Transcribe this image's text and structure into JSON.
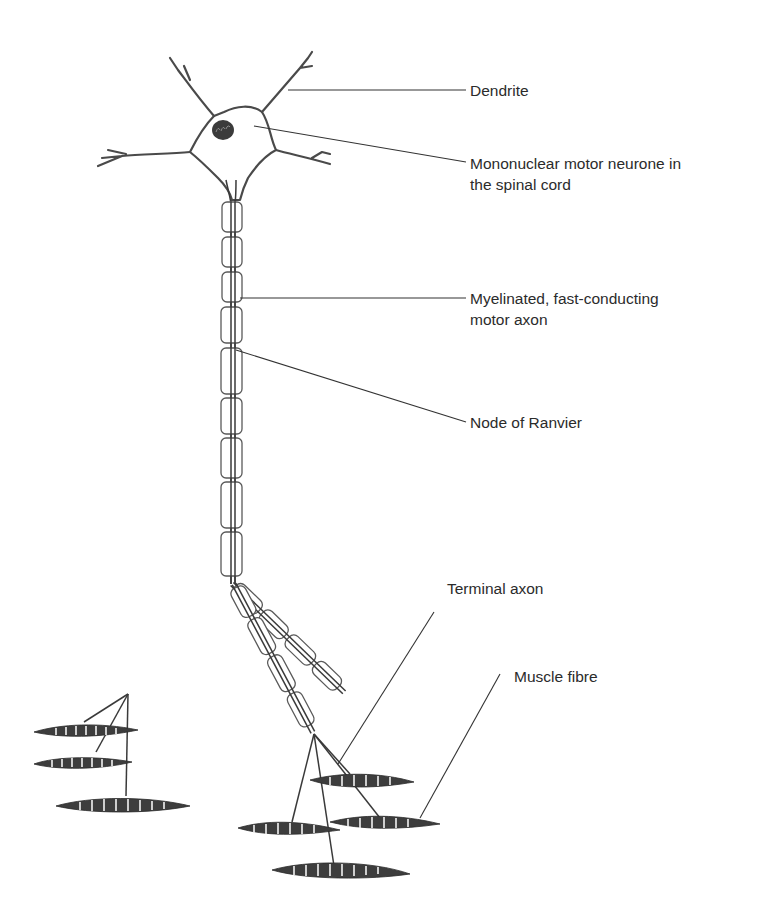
{
  "figure": {
    "labels": {
      "dendrite": {
        "lines": [
          "Dendrite"
        ]
      },
      "cell_body": {
        "lines": [
          "Mononuclear motor neurone in",
          "the spinal cord"
        ]
      },
      "myelinated_axon": {
        "lines": [
          "Myelinated, fast-conducting",
          "motor axon"
        ]
      },
      "node_of_ranvier": {
        "lines": [
          "Node of Ranvier"
        ]
      },
      "terminal_axon": {
        "lines": [
          "Terminal axon"
        ]
      },
      "muscle_fibre": {
        "lines": [
          "Muscle fibre"
        ]
      }
    },
    "colors": {
      "ink": "#3a3a3a",
      "text": "#2b2b2b",
      "background": "#ffffff"
    },
    "structure": {
      "myelin_segments_main_axon": 10,
      "axon_branches": 2,
      "muscle_fibres": 6
    }
  }
}
